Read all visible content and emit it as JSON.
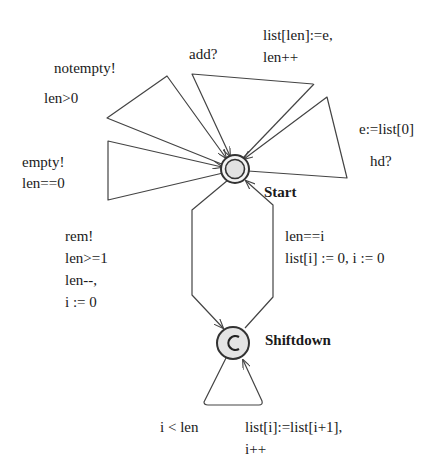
{
  "diagram": {
    "type": "timed-automaton",
    "locations": [
      {
        "id": "start",
        "name": "Start",
        "initial": true,
        "committed": false
      },
      {
        "id": "shiftdown",
        "name": "Shiftdown",
        "initial": false,
        "committed": true,
        "marker": "C"
      }
    ],
    "edges": [
      {
        "id": "notempty",
        "from": "start",
        "to": "start",
        "sync": "notempty!",
        "guard": "len>0",
        "update": ""
      },
      {
        "id": "empty",
        "from": "start",
        "to": "start",
        "sync": "empty!",
        "guard": "len==0",
        "update": ""
      },
      {
        "id": "add",
        "from": "start",
        "to": "start",
        "sync": "add?",
        "guard": "",
        "update_lines": [
          "list[len]:=e,",
          "len++"
        ]
      },
      {
        "id": "hd",
        "from": "start",
        "to": "start",
        "sync": "hd?",
        "guard": "",
        "update": "e:=list[0]"
      },
      {
        "id": "rem",
        "from": "start",
        "to": "shiftdown",
        "sync": "rem!",
        "guard": "len>=1",
        "update_lines": [
          "len--,",
          "i := 0"
        ]
      },
      {
        "id": "back",
        "from": "shiftdown",
        "to": "start",
        "sync": "",
        "guard": "len==i",
        "update": "list[i] := 0, i := 0"
      },
      {
        "id": "shift",
        "from": "shiftdown",
        "to": "shiftdown",
        "sync": "",
        "guard": "i < len",
        "update_lines": [
          "list[i]:=list[i+1],",
          "i++"
        ]
      }
    ]
  },
  "colors": {
    "line": "#444444",
    "node_fill": "#e4e4e4",
    "text": "#1a1a1a"
  }
}
